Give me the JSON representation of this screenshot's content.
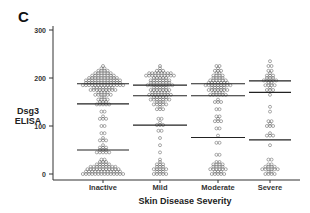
{
  "panel": {
    "label": "C"
  },
  "chart_data": {
    "type": "scatter",
    "subtype": "dot-strip plot with horizontal reference lines",
    "title": "",
    "xlabel": "Skin Disease Severity",
    "ylabel": "Dsg3 ELISA",
    "ylabel_lines": [
      "Dsg3",
      "ELISA"
    ],
    "categories": [
      "Inactive",
      "Mild",
      "Moderate",
      "Severe"
    ],
    "ylim": [
      0,
      300
    ],
    "yticks": [
      0,
      100,
      200,
      300
    ],
    "grid": false,
    "legend": null,
    "series": [
      {
        "name": "Inactive",
        "range": [
          0,
          225
        ],
        "reference_lines": [
          188,
          146,
          50
        ],
        "density_profile": [
          {
            "y": 0,
            "width": 14
          },
          {
            "y": 10,
            "width": 11
          },
          {
            "y": 20,
            "width": 5
          },
          {
            "y": 30,
            "width": 2
          },
          {
            "y": 45,
            "width": 5
          },
          {
            "y": 55,
            "width": 3
          },
          {
            "y": 70,
            "width": 3
          },
          {
            "y": 85,
            "width": 2
          },
          {
            "y": 100,
            "width": 2
          },
          {
            "y": 115,
            "width": 3
          },
          {
            "y": 130,
            "width": 2
          },
          {
            "y": 145,
            "width": 5
          },
          {
            "y": 155,
            "width": 4
          },
          {
            "y": 165,
            "width": 6
          },
          {
            "y": 175,
            "width": 9
          },
          {
            "y": 185,
            "width": 14
          },
          {
            "y": 195,
            "width": 12
          },
          {
            "y": 205,
            "width": 8
          },
          {
            "y": 215,
            "width": 4
          },
          {
            "y": 225,
            "width": 1
          }
        ]
      },
      {
        "name": "Mild",
        "range": [
          0,
          225
        ],
        "reference_lines": [
          185,
          163,
          102
        ],
        "density_profile": [
          {
            "y": 0,
            "width": 5
          },
          {
            "y": 10,
            "width": 5
          },
          {
            "y": 20,
            "width": 3
          },
          {
            "y": 30,
            "width": 1
          },
          {
            "y": 45,
            "width": 1
          },
          {
            "y": 60,
            "width": 1
          },
          {
            "y": 75,
            "width": 1
          },
          {
            "y": 90,
            "width": 2
          },
          {
            "y": 102,
            "width": 3
          },
          {
            "y": 115,
            "width": 2
          },
          {
            "y": 135,
            "width": 3
          },
          {
            "y": 145,
            "width": 5
          },
          {
            "y": 155,
            "width": 7
          },
          {
            "y": 165,
            "width": 8
          },
          {
            "y": 175,
            "width": 7
          },
          {
            "y": 185,
            "width": 9
          },
          {
            "y": 195,
            "width": 7
          },
          {
            "y": 205,
            "width": 10
          },
          {
            "y": 215,
            "width": 3
          },
          {
            "y": 225,
            "width": 1
          }
        ]
      },
      {
        "name": "Moderate",
        "range": [
          0,
          230
        ],
        "reference_lines": [
          188,
          163,
          76
        ],
        "density_profile": [
          {
            "y": 0,
            "width": 5
          },
          {
            "y": 10,
            "width": 6
          },
          {
            "y": 20,
            "width": 4
          },
          {
            "y": 40,
            "width": 2
          },
          {
            "y": 65,
            "width": 2
          },
          {
            "y": 80,
            "width": 1
          },
          {
            "y": 95,
            "width": 2
          },
          {
            "y": 110,
            "width": 3
          },
          {
            "y": 120,
            "width": 2
          },
          {
            "y": 135,
            "width": 2
          },
          {
            "y": 150,
            "width": 3
          },
          {
            "y": 165,
            "width": 6
          },
          {
            "y": 175,
            "width": 7
          },
          {
            "y": 185,
            "width": 9
          },
          {
            "y": 195,
            "width": 6
          },
          {
            "y": 205,
            "width": 4
          },
          {
            "y": 215,
            "width": 3
          },
          {
            "y": 225,
            "width": 2
          }
        ]
      },
      {
        "name": "Severe",
        "range": [
          0,
          240
        ],
        "reference_lines": [
          194,
          170,
          71
        ],
        "density_profile": [
          {
            "y": 0,
            "width": 4
          },
          {
            "y": 10,
            "width": 6
          },
          {
            "y": 20,
            "width": 2
          },
          {
            "y": 30,
            "width": 2
          },
          {
            "y": 60,
            "width": 1
          },
          {
            "y": 80,
            "width": 3
          },
          {
            "y": 100,
            "width": 3
          },
          {
            "y": 110,
            "width": 2
          },
          {
            "y": 130,
            "width": 1
          },
          {
            "y": 140,
            "width": 1
          },
          {
            "y": 165,
            "width": 1
          },
          {
            "y": 175,
            "width": 3
          },
          {
            "y": 185,
            "width": 4
          },
          {
            "y": 195,
            "width": 5
          },
          {
            "y": 205,
            "width": 3
          },
          {
            "y": 215,
            "width": 2
          },
          {
            "y": 225,
            "width": 2
          },
          {
            "y": 235,
            "width": 1
          }
        ]
      }
    ]
  },
  "colors": {
    "ink": "#333333",
    "marker_stroke": "#555555",
    "background": "#ffffff"
  }
}
